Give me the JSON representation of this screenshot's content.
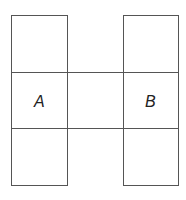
{
  "diagram": {
    "type": "grid-figure",
    "labels": {
      "a": "A",
      "b": "B"
    },
    "line_color": "#555555",
    "background": "#ffffff"
  }
}
